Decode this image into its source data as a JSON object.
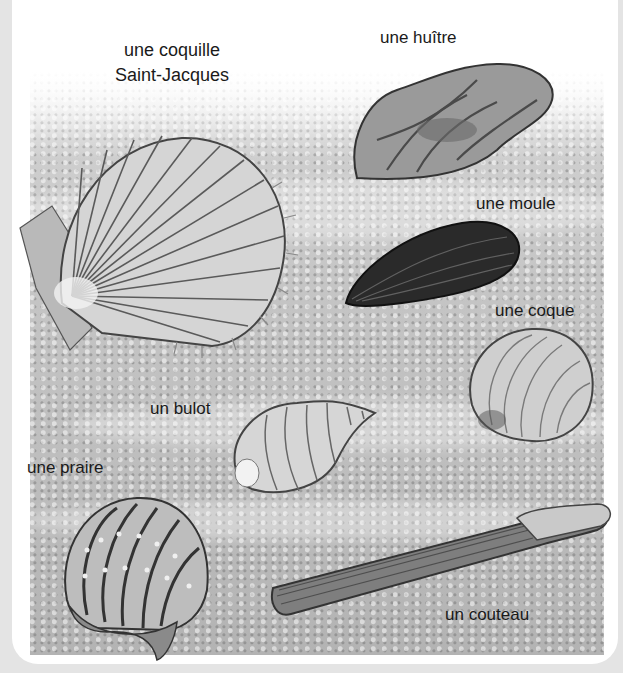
{
  "illustration": {
    "subject": "seashells on sand",
    "labels": {
      "scallop_line1": "une coquille",
      "scallop_line2": "Saint-Jacques",
      "oyster": "une huître",
      "mussel": "une moule",
      "cockle": "une coque",
      "whelk": "un bulot",
      "clam": "une praire",
      "razor": "un couteau"
    }
  }
}
